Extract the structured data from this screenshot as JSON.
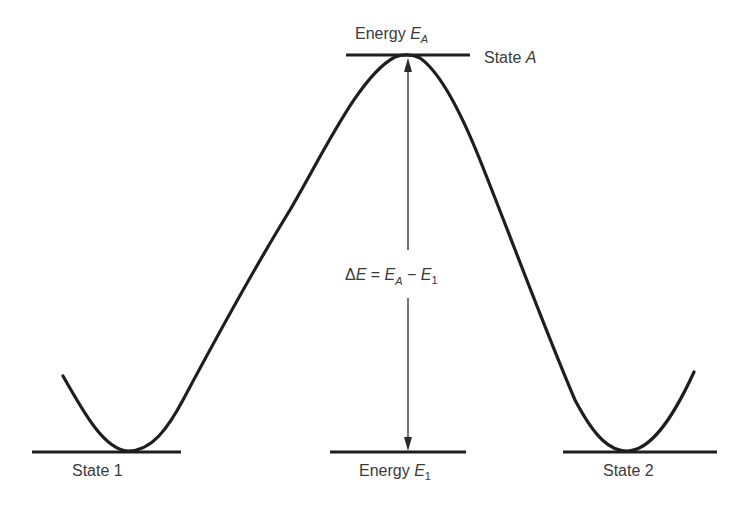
{
  "diagram": {
    "type": "energy-barrier",
    "colors": {
      "line": "#1e1e1e",
      "text": "#3a3a3a",
      "background": "#ffffff"
    },
    "top_label": {
      "prefix": "Energy ",
      "symbol": "E",
      "subscript": "A"
    },
    "state_a_label": {
      "prefix": "State ",
      "symbol": "A"
    },
    "delta_label": {
      "delta": "Δ",
      "E": "E",
      "equals": " = ",
      "EA": "E",
      "EA_sub": "A",
      "minus": " − ",
      "E1": "E",
      "E1_sub": "1"
    },
    "state1_label": "State 1",
    "state2_label": "State 2",
    "bottom_label": {
      "prefix": "Energy ",
      "symbol": "E",
      "subscript": "1"
    }
  }
}
